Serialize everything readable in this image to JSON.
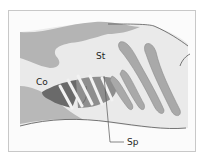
{
  "diagram": {
    "labels": {
      "co": "Co",
      "st": "St",
      "sp": "Sp"
    },
    "colors": {
      "background": "#fbfbfb",
      "body_light": "#e9e9e9",
      "tissue_mid": "#b4b4b4",
      "rib_fill": "#a9a9a9",
      "spleen_dark": "#6a6a6a",
      "spleen_mid": "#8c8c8c",
      "frame": "#c8c8c8",
      "leader_line": "#555555"
    }
  }
}
